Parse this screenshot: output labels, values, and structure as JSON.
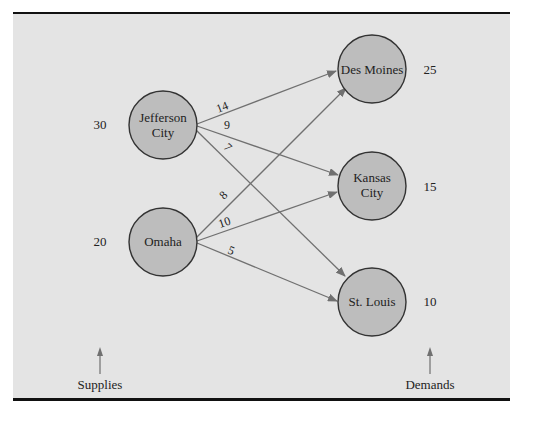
{
  "diagram": {
    "type": "transportation-network",
    "colors": {
      "background": "#e4e4e4",
      "node_fill": "#bdbdbd",
      "node_stroke": "#333333",
      "edge": "#707070",
      "rule": "#111111"
    },
    "origins": [
      {
        "id": "jc",
        "label_line1": "Jefferson",
        "label_line2": "City",
        "supply": "30"
      },
      {
        "id": "om",
        "label_line1": "Omaha",
        "label_line2": "",
        "supply": "20"
      }
    ],
    "destinations": [
      {
        "id": "dm",
        "label_line1": "Des Moines",
        "label_line2": "",
        "demand": "25"
      },
      {
        "id": "kc",
        "label_line1": "Kansas",
        "label_line2": "City",
        "demand": "15"
      },
      {
        "id": "sl",
        "label_line1": "St. Louis",
        "label_line2": "",
        "demand": "10"
      }
    ],
    "edges": [
      {
        "from": "Jefferson City",
        "to": "Des Moines",
        "cost": "14"
      },
      {
        "from": "Jefferson City",
        "to": "Kansas City",
        "cost": "9"
      },
      {
        "from": "Jefferson City",
        "to": "St. Louis",
        "cost": "7"
      },
      {
        "from": "Omaha",
        "to": "Des Moines",
        "cost": "8"
      },
      {
        "from": "Omaha",
        "to": "Kansas City",
        "cost": "10"
      },
      {
        "from": "Omaha",
        "to": "St. Louis",
        "cost": "5"
      }
    ],
    "captions": {
      "supplies": "Supplies",
      "demands": "Demands"
    }
  }
}
